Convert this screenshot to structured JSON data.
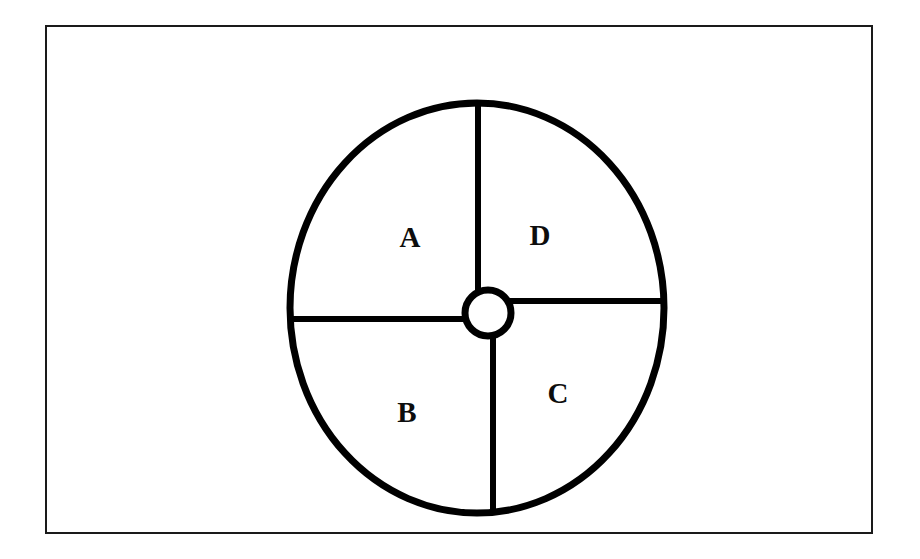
{
  "figure": {
    "background_color": "#ffffff",
    "ink_color": "#000000",
    "border": {
      "name": "figure-frame",
      "x": 46,
      "y": 26,
      "width": 826,
      "height": 507,
      "stroke_width": 2,
      "color": "#1a1a1a"
    },
    "ellipse": {
      "name": "outer-circle",
      "cx": 477,
      "cy": 308,
      "rx": 187,
      "ry": 205,
      "stroke_width": 7,
      "color": "#000000"
    },
    "hub": {
      "name": "center-hub-circle",
      "cx": 488,
      "cy": 313,
      "r": 23,
      "stroke_width": 7,
      "color": "#000000"
    },
    "spokes": [
      {
        "name": "spoke-top",
        "orientation": "vertical",
        "x1": 478,
        "y1": 103,
        "x2": 478,
        "y2": 291,
        "stroke_width": 6
      },
      {
        "name": "spoke-left",
        "orientation": "horizontal",
        "x1": 290,
        "y1": 319,
        "x2": 466,
        "y2": 319,
        "stroke_width": 6
      },
      {
        "name": "spoke-bottom",
        "orientation": "vertical",
        "x1": 493,
        "y1": 335,
        "x2": 493,
        "y2": 513,
        "stroke_width": 6
      },
      {
        "name": "spoke-right",
        "orientation": "horizontal",
        "x1": 510,
        "y1": 301,
        "x2": 664,
        "y2": 301,
        "stroke_width": 6
      }
    ],
    "labels": [
      {
        "name": "label-a",
        "text": "A",
        "x": 410,
        "y": 240,
        "quadrant": "upper-left"
      },
      {
        "name": "label-d",
        "text": "D",
        "x": 540,
        "y": 238,
        "quadrant": "upper-right"
      },
      {
        "name": "label-b",
        "text": "B",
        "x": 407,
        "y": 415,
        "quadrant": "lower-left"
      },
      {
        "name": "label-c",
        "text": "C",
        "x": 558,
        "y": 396,
        "quadrant": "lower-right"
      }
    ]
  },
  "chart_data": {
    "type": "pie",
    "title": "",
    "categories": [
      "A",
      "D",
      "C",
      "B"
    ],
    "values": [
      25,
      25,
      25,
      25
    ],
    "labels_shown": [
      "A",
      "B",
      "C",
      "D"
    ],
    "legend": "none"
  }
}
